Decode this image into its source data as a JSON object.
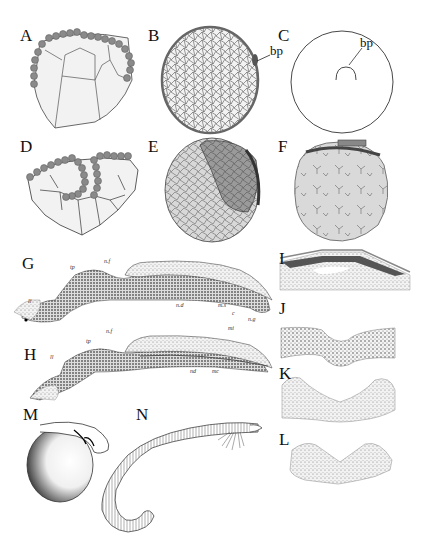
{
  "figure": {
    "panels": [
      {
        "id": "A",
        "label": "A",
        "description": "Early embryo section with dark marginal cells capping large yolk cells"
      },
      {
        "id": "B",
        "label": "B",
        "description": "Circular embryo section filled with small cells, darker rim"
      },
      {
        "id": "C",
        "label": "C",
        "description": "Outline of egg with blastopore lip"
      },
      {
        "id": "D",
        "label": "D",
        "description": "Section showing invaginating dark cell layer"
      },
      {
        "id": "E",
        "label": "E",
        "description": "Egg with dark shaded dorsal region over lighter cells"
      },
      {
        "id": "F",
        "label": "F",
        "description": "Egg with pale branching cell outlines and dark dorsal cap"
      },
      {
        "id": "G",
        "label": "G",
        "description": "Stippled longitudinal section of embryo"
      },
      {
        "id": "H",
        "label": "H",
        "description": "Stippled longitudinal section of embryo, later stage"
      },
      {
        "id": "I",
        "label": "I",
        "description": "Transverse section with layered tissue"
      },
      {
        "id": "J",
        "label": "J",
        "description": "Curved tissue section"
      },
      {
        "id": "K",
        "label": "K",
        "description": "Curved tissue section, deeper fold"
      },
      {
        "id": "L",
        "label": "L",
        "description": "Curved tissue section, V-shaped"
      },
      {
        "id": "M",
        "label": "M",
        "description": "Embryo curled around yolk sac"
      },
      {
        "id": "N",
        "label": "N",
        "description": "Elongated larva with external gills"
      }
    ],
    "annotations": {
      "bp_b": "bp",
      "bp_c": "bp",
      "g_ll": "ll",
      "g_tp": "tp",
      "g_nf": "n.f",
      "g_nd": "n.d",
      "g_ms": "m.s",
      "g_c": "c",
      "g_ng": "n.g",
      "h_ll": "ll",
      "h_tp": "tp",
      "h_nf": "n.f",
      "h_mi": "mi",
      "h_nd": "nd",
      "h_mc": "mc"
    }
  }
}
